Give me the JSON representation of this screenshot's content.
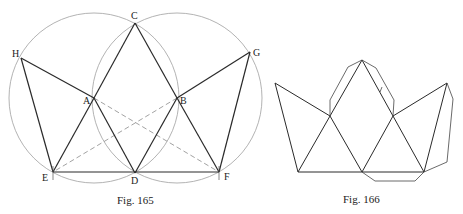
{
  "figures": [
    {
      "caption": "Fig. 165",
      "points": {
        "C": "C",
        "H": "H",
        "A": "A",
        "B": "B",
        "G": "G",
        "E": "E",
        "D": "D",
        "F": "F"
      }
    },
    {
      "caption": "Fig. 166"
    }
  ],
  "colors": {
    "line": "#2a2a2a",
    "circle": "#9a9a9a",
    "dashed": "#8a8a8a"
  }
}
